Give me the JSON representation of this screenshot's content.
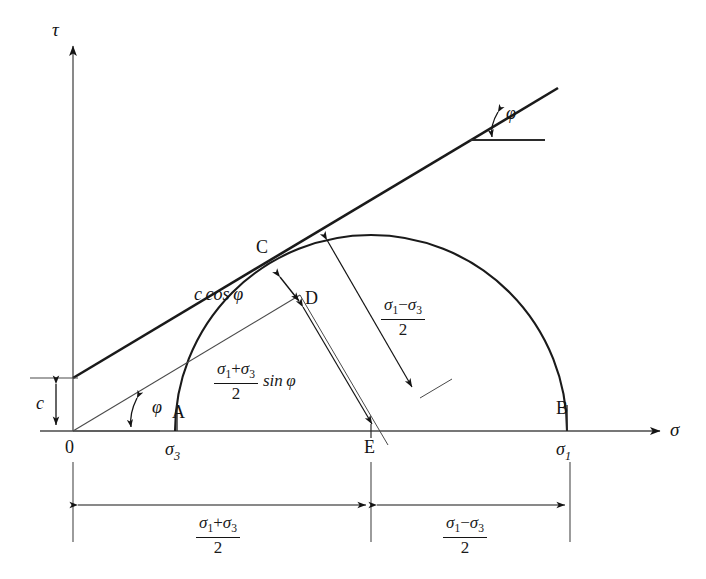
{
  "figure": {
    "type": "mohr-coulomb-failure-envelope",
    "axes": {
      "y_label": "τ",
      "x_label": "σ",
      "origin_label": "0"
    },
    "points": {
      "A": "A",
      "B": "B",
      "C": "C",
      "D": "D",
      "E": "E"
    },
    "stress_labels": {
      "sigma3": "σ",
      "sigma3_sub": "3",
      "sigma1": "σ",
      "sigma1_sub": "1"
    },
    "angles": {
      "phi_envelope": "φ",
      "phi_origin": "φ"
    },
    "cohesion": {
      "label": "c"
    },
    "annotations": {
      "c_cos_phi": "c cos φ",
      "radius": {
        "num_s1": "σ",
        "num_s1_sub": "1",
        "num_minus": "−",
        "num_s3": "σ",
        "num_s3_sub": "3",
        "den": "2"
      },
      "mean_sin_phi": {
        "num_s1": "σ",
        "num_s1_sub": "1",
        "num_plus": "+",
        "num_s3": "σ",
        "num_s3_sub": "3",
        "den": "2",
        "trailing": "sin φ"
      }
    },
    "dimensions": {
      "left": {
        "num_s1": "σ",
        "num_s1_sub": "1",
        "num_plus": "+",
        "num_s3": "σ",
        "num_s3_sub": "3",
        "den": "2"
      },
      "right": {
        "num_s1": "σ",
        "num_s1_sub": "1",
        "num_minus": "−",
        "num_s3": "σ",
        "num_s3_sub": "3",
        "den": "2"
      }
    },
    "colors": {
      "ink": "#141414",
      "line": "#2b2b2b",
      "thin": "#4a4a4a",
      "background": "#ffffff"
    }
  }
}
